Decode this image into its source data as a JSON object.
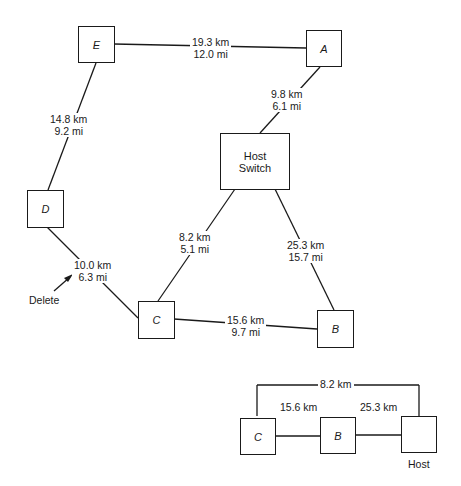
{
  "nodes": {
    "E": {
      "label": "E"
    },
    "A": {
      "label": "A"
    },
    "D": {
      "label": "D"
    },
    "C": {
      "label": "C"
    },
    "B": {
      "label": "B"
    },
    "host_switch": {
      "line1": "Host",
      "line2": "Switch"
    }
  },
  "links": {
    "E_A": {
      "km": "19.3 km",
      "mi": "12.0 mi"
    },
    "A_host": {
      "km": "9.8 km",
      "mi": "6.1 mi"
    },
    "E_D": {
      "km": "14.8 km",
      "mi": "9.2 mi"
    },
    "D_C": {
      "km": "10.0 km",
      "mi": "6.3 mi"
    },
    "host_C": {
      "km": "8.2 km",
      "mi": "5.1 mi"
    },
    "host_B": {
      "km": "25.3 km",
      "mi": "15.7 mi"
    },
    "C_B": {
      "km": "15.6 km",
      "mi": "9.7 mi"
    }
  },
  "annotation": {
    "delete_label": "Delete"
  },
  "inset": {
    "nodes": {
      "C": "C",
      "B": "B",
      "host_label": "Host"
    },
    "links": {
      "C_host": "8.2 km",
      "C_B": "15.6 km",
      "B_host": "25.3 km"
    }
  }
}
